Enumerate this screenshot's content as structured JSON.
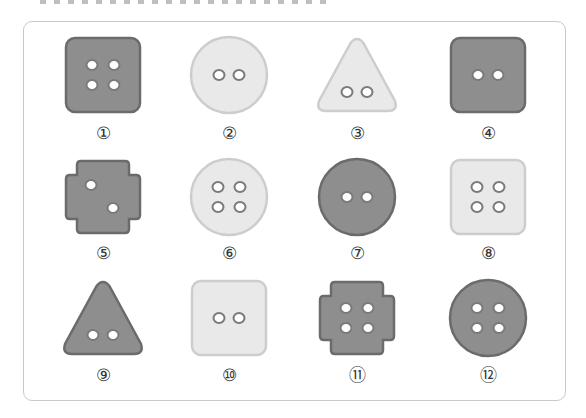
{
  "header": {
    "text_cropped": true
  },
  "colors": {
    "dark_fill": "#8e8e8e",
    "dark_border": "#6b6b6b",
    "light_fill": "#e9e9e9",
    "light_border": "#cdcdcd",
    "hole_fill": "#ffffff",
    "hole_ring": "#7a7a7a",
    "frame_border": "#c9c9c9"
  },
  "buttons": [
    {
      "label": "①",
      "shape": "square",
      "tone": "dark",
      "holes": 4
    },
    {
      "label": "②",
      "shape": "circle",
      "tone": "light",
      "holes": 2
    },
    {
      "label": "③",
      "shape": "triangle",
      "tone": "light",
      "holes": 2
    },
    {
      "label": "④",
      "shape": "square",
      "tone": "dark",
      "holes": 2
    },
    {
      "label": "⑤",
      "shape": "cross",
      "tone": "dark",
      "holes": 2
    },
    {
      "label": "⑥",
      "shape": "circle",
      "tone": "light",
      "holes": 4
    },
    {
      "label": "⑦",
      "shape": "circle",
      "tone": "dark",
      "holes": 2
    },
    {
      "label": "⑧",
      "shape": "square",
      "tone": "light",
      "holes": 4
    },
    {
      "label": "⑨",
      "shape": "triangle",
      "tone": "dark",
      "holes": 2
    },
    {
      "label": "⑩",
      "shape": "square",
      "tone": "light",
      "holes": 2
    },
    {
      "label": "⑪",
      "shape": "cross",
      "tone": "dark",
      "holes": 4
    },
    {
      "label": "⑫",
      "shape": "circle",
      "tone": "dark",
      "holes": 4
    }
  ]
}
